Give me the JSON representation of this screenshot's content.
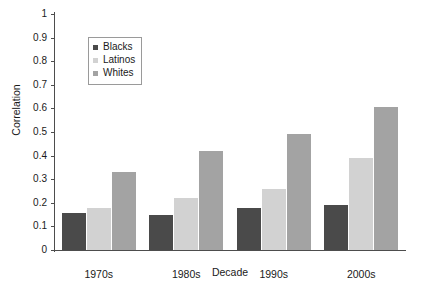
{
  "chart_data": {
    "type": "bar",
    "title": "",
    "xlabel": "Decade",
    "ylabel": "Correlation",
    "categories": [
      "1970s",
      "1980s",
      "1990s",
      "2000s"
    ],
    "series": [
      {
        "name": "Blacks",
        "color": "#4a4a4a",
        "values": [
          0.155,
          0.15,
          0.18,
          0.19
        ]
      },
      {
        "name": "Latinos",
        "color": "#d2d2d2",
        "values": [
          0.18,
          0.22,
          0.26,
          0.39
        ]
      },
      {
        "name": "Whites",
        "color": "#a3a3a3",
        "values": [
          0.33,
          0.42,
          0.49,
          0.605
        ]
      }
    ],
    "ylim": [
      0,
      1
    ],
    "yticks": [
      "0",
      "0.1",
      "0.2",
      "0.3",
      "0.4",
      "0.5",
      "0.6",
      "0.7",
      "0.8",
      "0.9",
      "1"
    ],
    "ytick_values": [
      0,
      0.1,
      0.2,
      0.3,
      0.4,
      0.5,
      0.6,
      0.7,
      0.8,
      0.9,
      1
    ],
    "grid": false,
    "legend_position": "upper-left-inside",
    "axis_color": "#4d4d4d",
    "background": "#ffffff"
  }
}
